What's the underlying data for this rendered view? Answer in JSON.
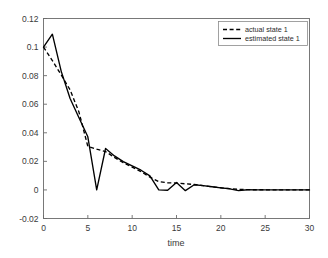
{
  "chart_data": {
    "type": "line",
    "title": "",
    "xlabel": "time",
    "ylabel": "",
    "xlim": [
      0,
      30
    ],
    "ylim": [
      -0.02,
      0.12
    ],
    "xticks": [
      "0",
      "5",
      "10",
      "15",
      "20",
      "25",
      "30"
    ],
    "yticks": [
      "0.12",
      "0.1",
      "0.08",
      "0.06",
      "0.04",
      "0.02",
      "0",
      "-0.02"
    ],
    "xtick_values": [
      0,
      5,
      10,
      15,
      20,
      25,
      30
    ],
    "ytick_values": [
      0.12,
      0.1,
      0.08,
      0.06,
      0.04,
      0.02,
      0,
      -0.02
    ],
    "grid": false,
    "legend_position": "upper right",
    "x": [
      0,
      1,
      2,
      3,
      4,
      5,
      6,
      7,
      8,
      9,
      10,
      11,
      12,
      13,
      14,
      15,
      16,
      17,
      18,
      19,
      20,
      21,
      22,
      23,
      24,
      25,
      26,
      27,
      28,
      29,
      30
    ],
    "series": [
      {
        "name": "actual state 1",
        "style": "dashed",
        "color": "#000000",
        "values": [
          0.1,
          0.0905,
          0.0805,
          0.07,
          0.0545,
          0.0305,
          0.0285,
          0.0268,
          0.0228,
          0.019,
          0.016,
          0.0128,
          0.009,
          0.0058,
          0.005,
          0.0048,
          0.0043,
          0.0038,
          0.003,
          0.0022,
          0.0015,
          0.0009,
          0.0004,
          0.0002,
          0.0001,
          0.0001,
          0.0,
          0.0,
          0.0,
          0.0,
          0.0
        ]
      },
      {
        "name": "estimated state 1",
        "style": "solid",
        "color": "#000000",
        "values": [
          0.1,
          0.109,
          0.083,
          0.064,
          0.0505,
          0.0372,
          0.0,
          0.029,
          0.0238,
          0.0198,
          0.0168,
          0.0138,
          0.0098,
          0.0,
          -0.0002,
          0.0052,
          -0.0005,
          0.0036,
          0.003,
          0.0022,
          0.0014,
          0.0008,
          -0.0005,
          0.0001,
          0.0,
          0.0,
          0.0,
          0.0,
          0.0,
          0.0,
          0.0
        ]
      }
    ]
  },
  "legend": {
    "entries": [
      {
        "label": "actual state 1",
        "style": "dashed"
      },
      {
        "label": "estimated state 1",
        "style": "solid"
      }
    ]
  }
}
